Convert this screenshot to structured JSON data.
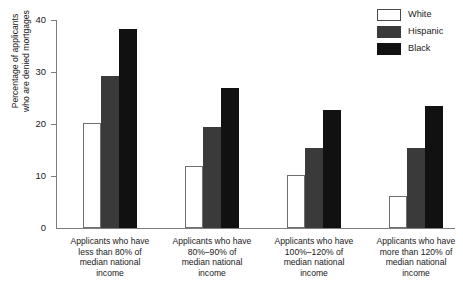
{
  "chart_data": {
    "type": "bar",
    "title": "",
    "xlabel": "",
    "ylabel": "Percentage of applicants who are denied mortgages",
    "ylabel_line1": "Percentage of applicants",
    "ylabel_line2": "who are denied mortgages",
    "ylim": [
      0,
      40
    ],
    "yticks": [
      0,
      10,
      20,
      30,
      40
    ],
    "ytick_labels": [
      "0",
      "10",
      "20",
      "30",
      "40"
    ],
    "grid": false,
    "legend_position": "top-right",
    "categories": [
      "Applicants who have less than 80% of median national income",
      "Applicants who have 80%–90% of median national income",
      "Applicants who have 100%–120% of median national income",
      "Applicants who have more than 120% of median national income"
    ],
    "category_lines": [
      [
        "Applicants who have",
        "less than 80% of",
        "median national",
        "income"
      ],
      [
        "Applicants who have",
        "80%–90% of",
        "median national",
        "income"
      ],
      [
        "Applicants who have",
        "100%–120% of",
        "median national",
        "income"
      ],
      [
        "Applicants who have",
        "more than 120% of",
        "median national",
        "income"
      ]
    ],
    "series": [
      {
        "name": "White",
        "color": "#ffffff",
        "values": [
          20.2,
          12.0,
          10.2,
          6.2
        ]
      },
      {
        "name": "Hispanic",
        "color": "#3a3a3a",
        "values": [
          29.2,
          19.4,
          15.4,
          15.4
        ]
      },
      {
        "name": "Black",
        "color": "#111111",
        "values": [
          38.2,
          26.9,
          22.6,
          23.4
        ]
      }
    ]
  },
  "legend": {
    "items": [
      {
        "label": "White",
        "swatch": "white"
      },
      {
        "label": "Hispanic",
        "swatch": "hisp"
      },
      {
        "label": "Black",
        "swatch": "black"
      }
    ]
  },
  "axis": {
    "y_title_line1": "Percentage of applicants",
    "y_title_line2": "who are denied mortgages",
    "tick_0": "0",
    "tick_10": "10",
    "tick_20": "20",
    "tick_30": "30",
    "tick_40": "40"
  },
  "colors": {
    "white_series": "#ffffff",
    "hispanic_series": "#3a3a3a",
    "black_series": "#111111",
    "axis": "#7d7d7d",
    "text": "#1a1a1a",
    "background": "#ffffff"
  }
}
